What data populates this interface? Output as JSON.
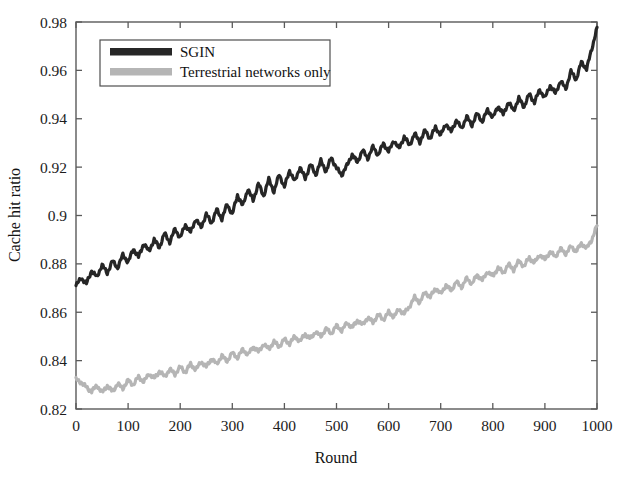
{
  "chart_data": {
    "type": "line",
    "title": "",
    "xlabel": "Round",
    "ylabel": "Cache hit ratio",
    "xlim": [
      0,
      1000
    ],
    "ylim": [
      0.82,
      0.98
    ],
    "grid": false,
    "legend_position": "upper-left",
    "xticks": [
      "0",
      "100",
      "200",
      "300",
      "400",
      "500",
      "600",
      "700",
      "800",
      "900",
      "1000"
    ],
    "xtick_values": [
      0,
      100,
      200,
      300,
      400,
      500,
      600,
      700,
      800,
      900,
      1000
    ],
    "yticks": [
      "0.82",
      "0.84",
      "0.86",
      "0.88",
      "0.9",
      "0.92",
      "0.94",
      "0.96",
      "0.98"
    ],
    "ytick_values": [
      0.82,
      0.84,
      0.86,
      0.88,
      0.9,
      0.92,
      0.94,
      0.96,
      0.98
    ],
    "series": [
      {
        "name": "SGIN",
        "color": "#262626",
        "linewidth": 3.2,
        "x": [
          0,
          10,
          20,
          30,
          40,
          50,
          60,
          70,
          80,
          90,
          100,
          110,
          120,
          130,
          140,
          150,
          160,
          170,
          180,
          190,
          200,
          210,
          220,
          230,
          240,
          250,
          260,
          270,
          280,
          290,
          300,
          310,
          320,
          330,
          340,
          350,
          360,
          370,
          380,
          390,
          400,
          410,
          420,
          430,
          440,
          450,
          460,
          470,
          480,
          490,
          500,
          510,
          520,
          530,
          540,
          550,
          560,
          570,
          580,
          590,
          600,
          610,
          620,
          630,
          640,
          650,
          660,
          670,
          680,
          690,
          700,
          710,
          720,
          730,
          740,
          750,
          760,
          770,
          780,
          790,
          800,
          810,
          820,
          830,
          840,
          850,
          860,
          870,
          880,
          890,
          900,
          910,
          920,
          930,
          940,
          950,
          960,
          970,
          980,
          990,
          1000
        ],
        "y": [
          0.871,
          0.8742,
          0.8718,
          0.8772,
          0.8745,
          0.8796,
          0.8762,
          0.8812,
          0.8784,
          0.8838,
          0.8806,
          0.8862,
          0.8828,
          0.8884,
          0.8852,
          0.89,
          0.8868,
          0.8926,
          0.889,
          0.8944,
          0.8908,
          0.8962,
          0.893,
          0.8986,
          0.895,
          0.9006,
          0.8968,
          0.9024,
          0.8986,
          0.9046,
          0.9006,
          0.9084,
          0.904,
          0.911,
          0.9062,
          0.9132,
          0.908,
          0.915,
          0.9098,
          0.917,
          0.9118,
          0.9186,
          0.914,
          0.92,
          0.9152,
          0.9212,
          0.9168,
          0.9226,
          0.9182,
          0.924,
          0.9196,
          0.9168,
          0.9206,
          0.9252,
          0.922,
          0.927,
          0.9236,
          0.9284,
          0.925,
          0.9298,
          0.9264,
          0.931,
          0.9276,
          0.9326,
          0.929,
          0.9338,
          0.9304,
          0.9352,
          0.9318,
          0.9366,
          0.9332,
          0.938,
          0.9346,
          0.9394,
          0.936,
          0.9408,
          0.9374,
          0.9422,
          0.9388,
          0.9438,
          0.9404,
          0.9452,
          0.9418,
          0.9468,
          0.9434,
          0.9484,
          0.945,
          0.9502,
          0.9468,
          0.952,
          0.9486,
          0.9538,
          0.9504,
          0.9556,
          0.9524,
          0.9596,
          0.9562,
          0.9634,
          0.9606,
          0.9688,
          0.9778
        ]
      },
      {
        "name": "Terrestrial networks only",
        "color": "#b5b5b5",
        "linewidth": 3.2,
        "x": [
          0,
          10,
          20,
          30,
          40,
          50,
          60,
          70,
          80,
          90,
          100,
          110,
          120,
          130,
          140,
          150,
          160,
          170,
          180,
          190,
          200,
          210,
          220,
          230,
          240,
          250,
          260,
          270,
          280,
          290,
          300,
          310,
          320,
          330,
          340,
          350,
          360,
          370,
          380,
          390,
          400,
          410,
          420,
          430,
          440,
          450,
          460,
          470,
          480,
          490,
          500,
          510,
          520,
          530,
          540,
          550,
          560,
          570,
          580,
          590,
          600,
          610,
          620,
          630,
          640,
          650,
          660,
          670,
          680,
          690,
          700,
          710,
          720,
          730,
          740,
          750,
          760,
          770,
          780,
          790,
          800,
          810,
          820,
          830,
          840,
          850,
          860,
          870,
          880,
          890,
          900,
          910,
          920,
          930,
          940,
          950,
          960,
          970,
          980,
          990,
          1000
        ],
        "y": [
          0.8322,
          0.831,
          0.829,
          0.8272,
          0.8298,
          0.8268,
          0.8296,
          0.8272,
          0.8304,
          0.8286,
          0.8318,
          0.83,
          0.8334,
          0.8312,
          0.8346,
          0.8326,
          0.8356,
          0.8334,
          0.8364,
          0.8344,
          0.8374,
          0.8352,
          0.8386,
          0.8362,
          0.8396,
          0.8374,
          0.8408,
          0.8386,
          0.842,
          0.8398,
          0.8432,
          0.8412,
          0.8446,
          0.8424,
          0.8458,
          0.8436,
          0.8468,
          0.8448,
          0.8478,
          0.8458,
          0.8488,
          0.847,
          0.85,
          0.848,
          0.851,
          0.849,
          0.852,
          0.85,
          0.8532,
          0.8512,
          0.8544,
          0.8524,
          0.8556,
          0.8536,
          0.8566,
          0.8548,
          0.8578,
          0.8558,
          0.859,
          0.857,
          0.86,
          0.8582,
          0.8612,
          0.8594,
          0.8624,
          0.8662,
          0.864,
          0.8684,
          0.8662,
          0.87,
          0.8676,
          0.8712,
          0.869,
          0.8726,
          0.8704,
          0.874,
          0.8718,
          0.8754,
          0.8732,
          0.8768,
          0.8748,
          0.8784,
          0.8762,
          0.8798,
          0.8776,
          0.8812,
          0.879,
          0.8826,
          0.8804,
          0.8838,
          0.8818,
          0.885,
          0.883,
          0.8862,
          0.8842,
          0.8872,
          0.8852,
          0.8884,
          0.8864,
          0.89,
          0.8958
        ]
      }
    ]
  },
  "legend": {
    "entries": [
      {
        "label": "SGIN",
        "color": "#262626"
      },
      {
        "label": "Terrestrial networks only",
        "color": "#b5b5b5"
      }
    ]
  },
  "colors": {
    "sgin": "#262626",
    "terrestrial": "#b5b5b5",
    "axis": "#5a5a5a",
    "text": "#1c1c1c",
    "background": "#ffffff"
  }
}
